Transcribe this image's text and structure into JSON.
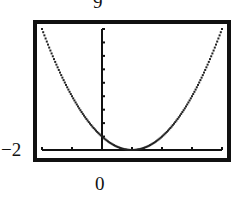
{
  "chart_data": {
    "type": "line",
    "title": "",
    "function": "y = (x - 1)^2",
    "xlabel": "",
    "ylabel": "",
    "xlim": [
      -2,
      4
    ],
    "ylim": [
      0,
      9
    ],
    "x_tick_step": 1,
    "y_tick_step": 1,
    "grid": false,
    "legend": null,
    "window_labels": {
      "ymax": "9",
      "xmin": "−2",
      "ymin": "0"
    },
    "series": [
      {
        "name": "parabola",
        "x": [
          -2,
          -1.5,
          -1,
          -0.5,
          0,
          0.5,
          1,
          1.5,
          2,
          2.5,
          3,
          3.5,
          4
        ],
        "values": [
          9,
          6.25,
          4,
          2.25,
          1,
          0.25,
          0,
          0.25,
          1,
          2.25,
          4,
          6.25,
          9
        ]
      }
    ]
  },
  "labels": {
    "top": "9",
    "left": "−2",
    "bottom": "0"
  },
  "colors": {
    "frame": "#111111",
    "curve": "#222222",
    "axes": "#111111",
    "background": "#ffffff"
  }
}
